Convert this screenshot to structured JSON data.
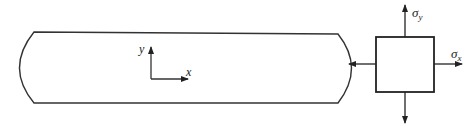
{
  "diagram": {
    "specimen": {
      "description": "elongated plate with curved ends",
      "axes": {
        "x_label": "x",
        "y_label": "y"
      }
    },
    "stress_element": {
      "description": "square element under biaxial tension",
      "labels": {
        "sigma_x": "σx",
        "sigma_y": "σy",
        "sigma_x_base": "σ",
        "sigma_x_sub": "x",
        "sigma_y_base": "σ",
        "sigma_y_sub": "y"
      }
    },
    "colors": {
      "stroke": "#333333",
      "background": "#ffffff"
    }
  }
}
